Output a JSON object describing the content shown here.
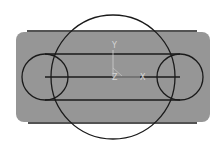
{
  "diagram": {
    "title": "",
    "colors": {
      "background": "#ffffff",
      "plate_fill": "#969696",
      "stroke": "#1a1a1a",
      "axis": "#d0d0d0"
    },
    "plate": {
      "x": 16,
      "y": 32,
      "width": 194,
      "height": 90,
      "rx": 8
    },
    "lines": [
      {
        "id": "top-edge-line",
        "x1": 27,
        "y1": 31,
        "x2": 197,
        "y2": 31
      },
      {
        "id": "bottom-edge-line",
        "x1": 28,
        "y1": 123,
        "x2": 197,
        "y2": 123
      },
      {
        "id": "slot-top-line",
        "x1": 45,
        "y1": 54,
        "x2": 180,
        "y2": 54
      },
      {
        "id": "slot-bottom-line",
        "x1": 45,
        "y1": 100,
        "x2": 180,
        "y2": 100
      },
      {
        "id": "center-line",
        "x1": 45,
        "y1": 77,
        "x2": 180,
        "y2": 77
      }
    ],
    "circles": [
      {
        "id": "large-circle",
        "cx": 113,
        "cy": 77,
        "r": 62
      },
      {
        "id": "left-small-circle",
        "cx": 45,
        "cy": 77,
        "r": 23
      },
      {
        "id": "right-small-circle",
        "cx": 180,
        "cy": 77,
        "r": 23
      }
    ],
    "axes": {
      "origin": {
        "x": 113,
        "y": 77
      },
      "y_label": "Y",
      "z_label": "Z",
      "x_label": "X"
    }
  }
}
